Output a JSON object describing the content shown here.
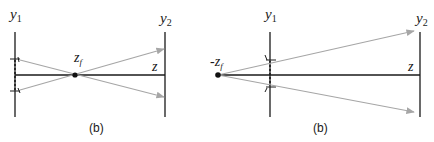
{
  "diagram": {
    "colors": {
      "axis": "#1a1a1a",
      "ray": "#a6a6a6",
      "point": "#111111"
    },
    "left_panel": {
      "y1_label": "y",
      "y1_sub": "1",
      "y2_label": "y",
      "y2_sub": "2",
      "focal_label": "z",
      "focal_sub": "f",
      "axis_label": "z",
      "caption": "(b)"
    },
    "right_panel": {
      "y1_label": "y",
      "y1_sub": "1",
      "y2_label": "y",
      "y2_sub": "2",
      "focal_label": "-z",
      "focal_sub": "f",
      "axis_label": "z",
      "caption": "(b)"
    }
  }
}
